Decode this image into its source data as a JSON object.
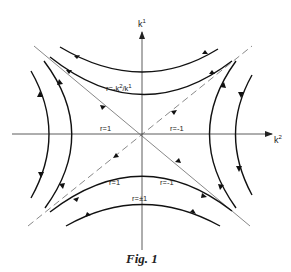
{
  "figure": {
    "caption": "Fig. 1",
    "type": "phase portrait (saddle point)",
    "axes": {
      "vertical": {
        "label": "k",
        "superscript": "1"
      },
      "horizontal": {
        "label": "k",
        "superscript": "2"
      }
    },
    "asymptotes": [
      {
        "style": "solid",
        "direction": "upper-left to lower-right"
      },
      {
        "style": "dashed",
        "direction": "lower-left to upper-right"
      }
    ],
    "labels": {
      "top_curve": "r = -k²/k¹",
      "top_curve_prefix": "r=-k",
      "top_curve_sup1": "2",
      "top_curve_mid": "/k",
      "top_curve_sup2": "1",
      "left_axis": "r=1",
      "right_axis": "r=-1",
      "bottom_left": "r=1",
      "bottom_right": "r=-1",
      "bottom_center": "r=±1"
    },
    "colors": {
      "line": "#222222",
      "background": "#ffffff"
    }
  }
}
